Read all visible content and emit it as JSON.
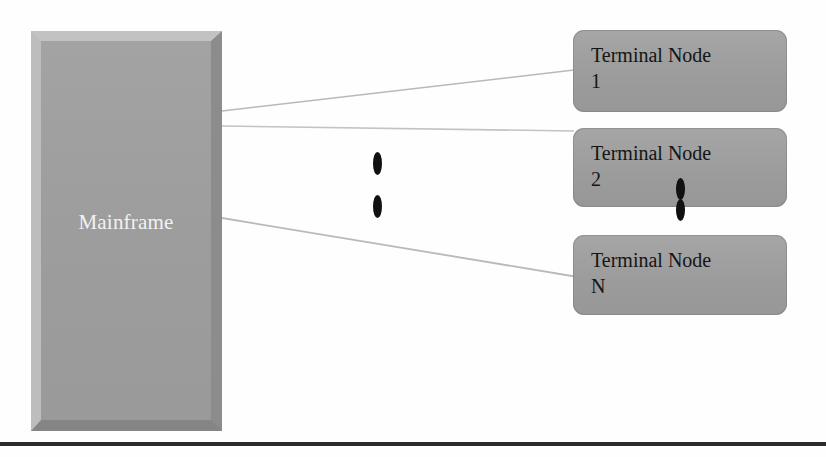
{
  "diagram": {
    "background_color": "#fefefe",
    "mainframe": {
      "label": "Mainframe",
      "fill_color": "#9d9d9d",
      "label_color": "#f2f2f2",
      "bevel_light_color": "#c2c2c2",
      "bevel_dark_color": "#858585"
    },
    "nodes": [
      {
        "label": "Terminal Node\n1",
        "name": "Terminal Node",
        "index": "1",
        "fill_color": "#9c9c9c",
        "text_color": "#151515"
      },
      {
        "label": "Terminal Node\n2",
        "name": "Terminal Node",
        "index": "2",
        "fill_color": "#9c9c9c",
        "text_color": "#151515"
      },
      {
        "label": "Terminal Node\nN",
        "name": "Terminal Node",
        "index": "N",
        "fill_color": "#9c9c9c",
        "text_color": "#151515"
      }
    ],
    "connectors": {
      "count": 3,
      "color": "#b9b9b9",
      "description": "Three thin lines from the mainframe right edge to each terminal node"
    },
    "ellipses": [
      {
        "name": "vertical-ellipsis-middle",
        "dots": 2,
        "color": "#111111"
      },
      {
        "name": "vertical-ellipsis-nodes",
        "dots": 2,
        "color": "#111111"
      }
    ],
    "bottom_rule": {
      "color": "#2b2b2b"
    }
  }
}
